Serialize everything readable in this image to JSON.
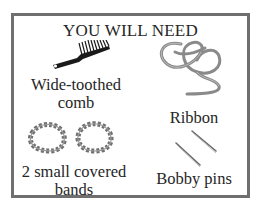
{
  "title": "YOU WILL NEED",
  "items": [
    {
      "name": "comb",
      "label_line1": "Wide-toothed",
      "label_line2": "comb",
      "icon": "comb-icon"
    },
    {
      "name": "ribbon",
      "label_line1": "Ribbon",
      "icon": "ribbon-icon"
    },
    {
      "name": "bands",
      "label_line1": "2 small covered",
      "label_line2": "bands",
      "icon": "hair-band-icon"
    },
    {
      "name": "bobby-pins",
      "label_line1": "Bobby pins",
      "icon": "bobby-pin-icon"
    }
  ],
  "colors": {
    "border": "#6f6f6f",
    "text": "#262626",
    "icon_dark": "#1a1a1a",
    "icon_gray": "#8a8a8a"
  }
}
